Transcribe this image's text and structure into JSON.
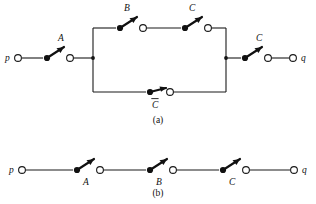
{
  "figure": {
    "colors": {
      "ink": "#111111",
      "wire": "#1a1a1a",
      "background": "#ffffff"
    },
    "panels": [
      {
        "id": "a",
        "caption": "(a)",
        "terminals": {
          "left": "p",
          "right": "q"
        },
        "switches": [
          {
            "name": "A",
            "label": "A",
            "label_position": "above",
            "negated": false,
            "branch": "input"
          },
          {
            "name": "B",
            "label": "B",
            "label_position": "above",
            "negated": false,
            "branch": "top"
          },
          {
            "name": "C-top",
            "label": "C",
            "label_position": "above",
            "negated": false,
            "branch": "top"
          },
          {
            "name": "C-bar",
            "label": "C",
            "label_position": "below",
            "negated": true,
            "branch": "bottom"
          },
          {
            "name": "C-out",
            "label": "C",
            "label_position": "above",
            "negated": false,
            "branch": "output"
          }
        ]
      },
      {
        "id": "b",
        "caption": "(b)",
        "terminals": {
          "left": "p",
          "right": "q"
        },
        "switches": [
          {
            "name": "A",
            "label": "A",
            "label_position": "below",
            "negated": false,
            "branch": "series"
          },
          {
            "name": "B",
            "label": "B",
            "label_position": "below",
            "negated": false,
            "branch": "series"
          },
          {
            "name": "C",
            "label": "C",
            "label_position": "below",
            "negated": false,
            "branch": "series"
          }
        ]
      }
    ]
  }
}
